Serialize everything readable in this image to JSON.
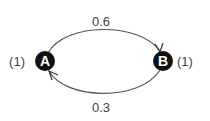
{
  "diagram": {
    "type": "state-transition-graph",
    "nodes": [
      {
        "id": "A",
        "label": "A",
        "weight_label": "(1)"
      },
      {
        "id": "B",
        "label": "B",
        "weight_label": "(1)"
      }
    ],
    "edges": [
      {
        "from": "A",
        "to": "B",
        "label": "0.6",
        "position": "top"
      },
      {
        "from": "B",
        "to": "A",
        "label": "0.3",
        "position": "bottom"
      }
    ],
    "colors": {
      "node_fill": "#111111",
      "node_text": "#ffffff",
      "edge": "#555555",
      "label": "#444444"
    }
  }
}
